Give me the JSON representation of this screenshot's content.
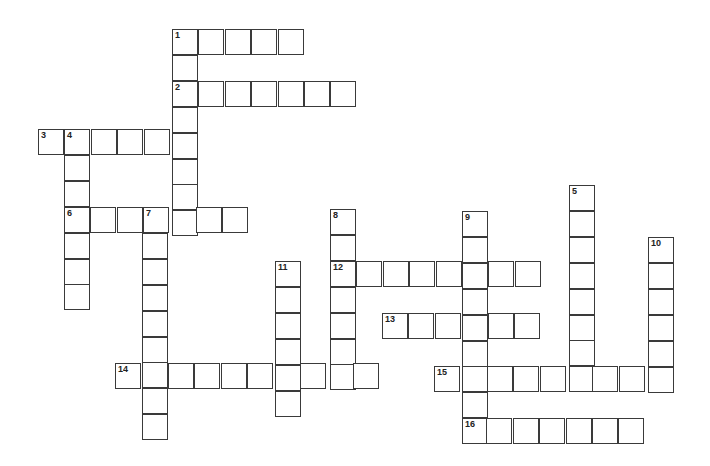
{
  "puzzle": {
    "type": "crossword",
    "cell_step_x": 26.4,
    "cell_step_y": 25.9,
    "cell_size": 26,
    "border_color": "#3a3a3a",
    "background": "#ffffff",
    "words": [
      {
        "number": "1",
        "direction": "across",
        "x": 172,
        "y": 29,
        "length": 5
      },
      {
        "number": "1",
        "direction": "down",
        "x": 172,
        "y": 29,
        "length": 8
      },
      {
        "number": "2",
        "direction": "across",
        "x": 172,
        "y": 81,
        "length": 7
      },
      {
        "number": "3",
        "direction": "across",
        "x": 38,
        "y": 129,
        "length": 6
      },
      {
        "number": "4",
        "direction": "down",
        "x": 64,
        "y": 129,
        "length": 7
      },
      {
        "number": "5",
        "direction": "down",
        "x": 569,
        "y": 185,
        "length": 8
      },
      {
        "number": "6",
        "direction": "across",
        "x": 64,
        "y": 207,
        "length": 7
      },
      {
        "number": "7",
        "direction": "down",
        "x": 142,
        "y": 207,
        "length": 9
      },
      {
        "number": "8",
        "direction": "down",
        "x": 330,
        "y": 209,
        "length": 7
      },
      {
        "number": "9",
        "direction": "down",
        "x": 462,
        "y": 211,
        "length": 9
      },
      {
        "number": "10",
        "direction": "down",
        "x": 648,
        "y": 237,
        "length": 6
      },
      {
        "number": "11",
        "direction": "down",
        "x": 275,
        "y": 261,
        "length": 6
      },
      {
        "number": "12",
        "direction": "across",
        "x": 330,
        "y": 261,
        "length": 8
      },
      {
        "number": "13",
        "direction": "across",
        "x": 382,
        "y": 313,
        "length": 6
      },
      {
        "number": "14",
        "direction": "across",
        "x": 115,
        "y": 363,
        "length": 10
      },
      {
        "number": "15",
        "direction": "across",
        "x": 434,
        "y": 366,
        "length": 9
      },
      {
        "number": "16",
        "direction": "across",
        "x": 460,
        "y": 418,
        "length": 7
      }
    ]
  }
}
